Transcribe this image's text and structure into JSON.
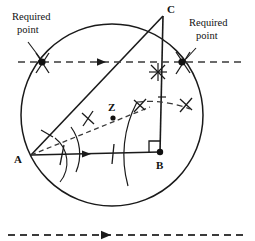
{
  "figure": {
    "width": 255,
    "height": 241,
    "background_color": "#ffffff",
    "stroke_color": "#1a1a1a",
    "dash_color": "#3a3a3a"
  },
  "labels": {
    "point_a": "A",
    "point_b": "B",
    "point_c": "C",
    "point_z": "Z",
    "required_point_left_line1": "Required",
    "required_point_left_line2": "point",
    "required_point_right_line1": "Required",
    "required_point_right_line2": "point"
  },
  "geometry": {
    "circle": {
      "cx": 112,
      "cy": 115,
      "r": 91
    },
    "points": {
      "A": {
        "x": 31,
        "y": 155
      },
      "B": {
        "x": 160,
        "y": 152
      },
      "C": {
        "x": 163,
        "y": 16
      },
      "Z": {
        "x": 113,
        "y": 117
      },
      "required_left": {
        "x": 42,
        "y": 62
      },
      "required_right": {
        "x": 182,
        "y": 62
      }
    },
    "segments": [
      {
        "name": "AB",
        "x1": 31,
        "y1": 155,
        "x2": 160,
        "y2": 152
      },
      {
        "name": "BC",
        "x1": 160,
        "y1": 152,
        "x2": 163,
        "y2": 16
      },
      {
        "name": "AC",
        "x1": 31,
        "y1": 155,
        "x2": 163,
        "y2": 16
      }
    ],
    "dashed_lines": [
      {
        "name": "construction-horizontal",
        "x1": 18,
        "y1": 62,
        "x2": 241,
        "y2": 62,
        "arrow_x": 103
      },
      {
        "name": "bisector-AZ",
        "x1": 31,
        "y1": 155,
        "x2": 148,
        "y2": 108
      },
      {
        "name": "given-direction",
        "x1": 8,
        "y1": 235,
        "x2": 247,
        "y2": 235,
        "arrow_x": 107
      }
    ],
    "arrow_marks": [
      {
        "name": "arrow-on-AB",
        "x": 88,
        "y": 154
      },
      {
        "name": "arrow-on-dashed-horizontal",
        "x": 103,
        "y": 62
      },
      {
        "name": "arrow-on-bottom-line",
        "x": 107,
        "y": 235
      }
    ],
    "right_angle": {
      "vertex_x": 160,
      "vertex_y": 152,
      "size": 11
    },
    "cross_marks": [
      {
        "name": "cross-on-AZ",
        "x": 88,
        "y": 119,
        "angle": 35
      },
      {
        "name": "cross-below-C",
        "x": 158,
        "y": 72,
        "angle": 0
      },
      {
        "name": "cross-arc-left",
        "x": 140,
        "y": 105,
        "angle": 20
      },
      {
        "name": "cross-arc-right",
        "x": 186,
        "y": 104,
        "angle": 20
      }
    ],
    "arcs": [
      {
        "name": "angle-arc-near-A-outer",
        "cx": 31,
        "cy": 155,
        "r": 46
      },
      {
        "name": "angle-arc-near-A-inner",
        "cx": 31,
        "cy": 155,
        "r": 31
      },
      {
        "name": "bisector-arc-large",
        "cx": 31,
        "cy": 155,
        "r": 113
      }
    ],
    "tick_marks": [
      {
        "name": "tick-on-AC-near-A",
        "x": 47,
        "y": 133
      },
      {
        "name": "tick-on-AB-near-A",
        "x": 62,
        "y": 154
      }
    ]
  },
  "callouts": [
    {
      "name": "required-point-left",
      "text_x": 8,
      "text_y": 22,
      "leader": {
        "x1": 30,
        "y1": 44,
        "x2": 41,
        "y2": 59
      }
    },
    {
      "name": "required-point-right",
      "text_x": 186,
      "text_y": 28,
      "leader": {
        "x1": 196,
        "y1": 48,
        "x2": 185,
        "y2": 60
      }
    }
  ]
}
